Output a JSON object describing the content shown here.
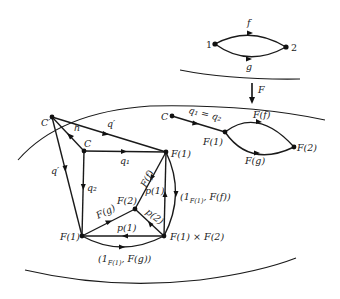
{
  "diagram": {
    "top_category": {
      "nodes": [
        {
          "id": "1",
          "label": "1"
        },
        {
          "id": "2",
          "label": "2"
        }
      ],
      "edges": [
        {
          "from": "1",
          "to": "2",
          "label": "f"
        },
        {
          "from": "1",
          "to": "2",
          "label": "g"
        }
      ]
    },
    "functor": {
      "label": "F"
    },
    "image_diagram": {
      "nodes": {
        "C": "C",
        "F1": "F(1)",
        "F2": "F(2)"
      },
      "edges": {
        "cone": "q₁ = q₂",
        "Ff": "F(f)",
        "Fg": "F(g)"
      }
    },
    "limit_construction": {
      "nodes": {
        "Cprime": "C′",
        "C": "C",
        "F1_top": "F(1)",
        "F2": "F(2)",
        "F1_bottom": "F(1)",
        "product": "F(1) × F(2)"
      },
      "edges": {
        "h": "h",
        "q_prime_top": "q′",
        "q_prime_left": "q′",
        "q1": "q₁",
        "q2": "q₂",
        "Ff": "F(f)",
        "Fg": "F(g)",
        "p1_up": "p(1)",
        "p2": "p(2)",
        "p1_left": "p(1)",
        "pair_f_main": "(1",
        "pair_f_sub": "F(1)",
        "pair_f_tail": ", F(f))",
        "pair_g_main": "(1",
        "pair_g_sub": "F(1)",
        "pair_g_tail": ", F(g))"
      }
    }
  }
}
